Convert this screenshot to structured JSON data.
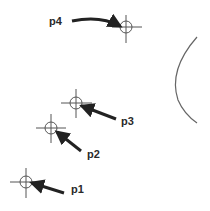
{
  "diagram": {
    "colors": {
      "line": "#555555",
      "arrow": "#222222",
      "label": "#2a2a2a"
    },
    "points": [
      {
        "id": "p1",
        "label": "p1",
        "x": 26,
        "y": 182
      },
      {
        "id": "p2",
        "label": "p2",
        "x": 51,
        "y": 128
      },
      {
        "id": "p3",
        "label": "p3",
        "x": 76,
        "y": 103
      },
      {
        "id": "p4",
        "label": "p4",
        "x": 126,
        "y": 27
      }
    ],
    "arc": {
      "description": "partial circle arc on right edge"
    }
  }
}
